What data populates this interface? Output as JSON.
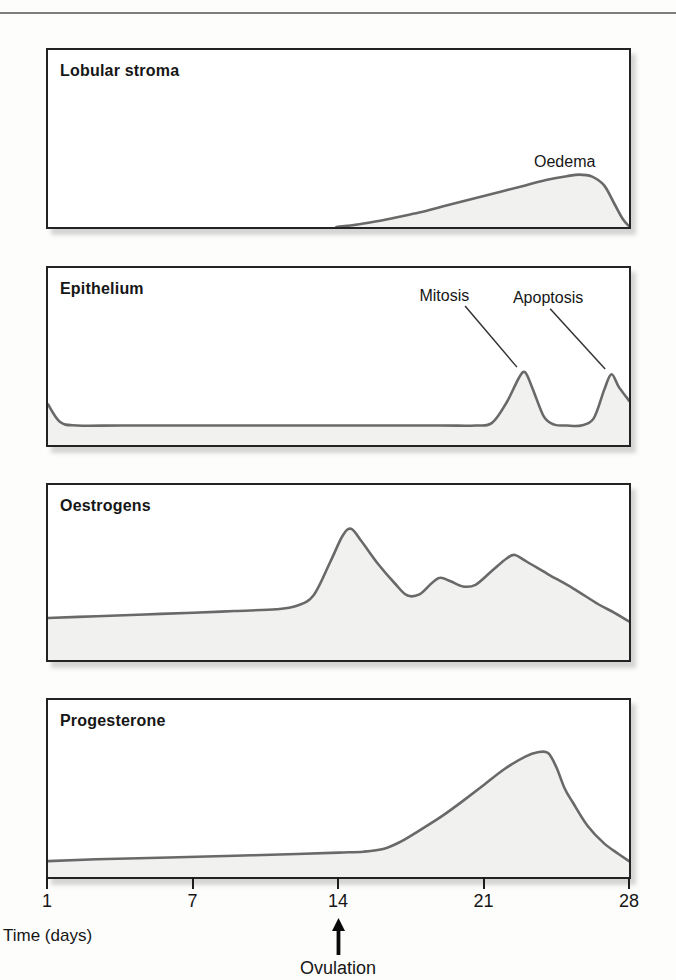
{
  "axis": {
    "axis_label": "Time (days)",
    "ticks": [
      {
        "label": "1",
        "day": 1
      },
      {
        "label": "7",
        "day": 7
      },
      {
        "label": "14",
        "day": 14
      },
      {
        "label": "21",
        "day": 21
      },
      {
        "label": "28",
        "day": 28
      }
    ],
    "ovulation": {
      "label": "Ovulation",
      "day": 14
    }
  },
  "chart_data": [
    {
      "type": "area",
      "title": "Lobular stroma",
      "xlabel": "Time (days)",
      "x_range": [
        1,
        28
      ],
      "x_ticks": [
        1,
        7,
        14,
        21,
        28
      ],
      "value_unit": "relative level (% of panel height)",
      "points": [
        [
          13.9,
          0
        ],
        [
          15,
          1.5
        ],
        [
          16,
          3.5
        ],
        [
          17,
          6
        ],
        [
          18,
          8.5
        ],
        [
          19,
          11.5
        ],
        [
          20,
          14.5
        ],
        [
          21,
          17.5
        ],
        [
          22,
          20.5
        ],
        [
          23,
          23.5
        ],
        [
          24,
          26.5
        ],
        [
          25,
          28.7
        ],
        [
          25.6,
          29.6
        ],
        [
          26.2,
          28.6
        ],
        [
          26.8,
          23.5
        ],
        [
          27.3,
          13
        ],
        [
          27.7,
          4.5
        ],
        [
          28,
          0.5
        ]
      ],
      "annotations": [
        {
          "text": "Oedema",
          "day": 24.9,
          "level": 37
        }
      ],
      "leaders": []
    },
    {
      "type": "area",
      "title": "Epithelium",
      "xlabel": "Time (days)",
      "x_range": [
        1,
        28
      ],
      "x_ticks": [
        1,
        7,
        14,
        21,
        28
      ],
      "value_unit": "relative level (% of panel height)",
      "points": [
        [
          1,
          23
        ],
        [
          1.5,
          13
        ],
        [
          2.2,
          11
        ],
        [
          4,
          11
        ],
        [
          7,
          11
        ],
        [
          10,
          11
        ],
        [
          13,
          11
        ],
        [
          16,
          11
        ],
        [
          19,
          11
        ],
        [
          20.6,
          11
        ],
        [
          21.4,
          12.5
        ],
        [
          22.1,
          24
        ],
        [
          22.7,
          38
        ],
        [
          23,
          41
        ],
        [
          23.35,
          32
        ],
        [
          23.9,
          16
        ],
        [
          24.4,
          11.5
        ],
        [
          25,
          11
        ],
        [
          25.7,
          11
        ],
        [
          26.3,
          15
        ],
        [
          26.8,
          31
        ],
        [
          27.15,
          40
        ],
        [
          27.5,
          33
        ],
        [
          28,
          25
        ]
      ],
      "annotations": [
        {
          "text": "Mitosis",
          "day": 19.1,
          "level": 84
        },
        {
          "text": "Apoptosis",
          "day": 24.1,
          "level": 83
        }
      ],
      "leaders": [
        {
          "from": [
            20.1,
            78.5
          ],
          "to": [
            22.6,
            44
          ]
        },
        {
          "from": [
            24.2,
            77
          ],
          "to": [
            26.85,
            43
          ]
        }
      ]
    },
    {
      "type": "area",
      "title": "Oestrogens",
      "xlabel": "Time (days)",
      "x_range": [
        1,
        28
      ],
      "x_ticks": [
        1,
        7,
        14,
        21,
        28
      ],
      "value_unit": "relative level (% of panel height)",
      "points": [
        [
          1,
          24
        ],
        [
          3,
          25
        ],
        [
          5,
          26
        ],
        [
          7,
          27
        ],
        [
          9,
          28
        ],
        [
          11,
          29
        ],
        [
          12,
          31
        ],
        [
          12.8,
          37
        ],
        [
          13.6,
          56
        ],
        [
          14.2,
          71
        ],
        [
          14.6,
          75
        ],
        [
          15.1,
          68
        ],
        [
          15.9,
          55
        ],
        [
          16.7,
          44
        ],
        [
          17.3,
          37
        ],
        [
          17.9,
          37.5
        ],
        [
          18.5,
          44
        ],
        [
          18.9,
          47
        ],
        [
          19.4,
          45
        ],
        [
          20,
          42
        ],
        [
          20.6,
          43
        ],
        [
          21.4,
          51
        ],
        [
          22.1,
          58
        ],
        [
          22.5,
          60
        ],
        [
          23.1,
          56
        ],
        [
          24.1,
          49
        ],
        [
          25.3,
          41
        ],
        [
          26.5,
          32
        ],
        [
          27.3,
          27
        ],
        [
          28,
          22
        ]
      ],
      "annotations": [],
      "leaders": []
    },
    {
      "type": "area",
      "title": "Progesterone",
      "xlabel": "Time (days)",
      "x_range": [
        1,
        28
      ],
      "x_ticks": [
        1,
        7,
        14,
        21,
        28
      ],
      "value_unit": "relative level (% of panel height)",
      "points": [
        [
          1,
          9
        ],
        [
          3,
          10
        ],
        [
          6,
          11
        ],
        [
          9,
          12
        ],
        [
          12,
          13
        ],
        [
          14,
          13.8
        ],
        [
          15.2,
          14.3
        ],
        [
          16.2,
          16
        ],
        [
          17,
          20
        ],
        [
          18,
          27
        ],
        [
          19,
          34.5
        ],
        [
          20,
          43
        ],
        [
          21,
          52
        ],
        [
          22,
          61
        ],
        [
          23,
          68
        ],
        [
          23.6,
          70.5
        ],
        [
          24.1,
          70
        ],
        [
          24.5,
          62
        ],
        [
          24.9,
          50
        ],
        [
          25.3,
          42
        ],
        [
          26,
          29
        ],
        [
          26.8,
          19
        ],
        [
          27.5,
          13
        ],
        [
          28,
          9
        ]
      ],
      "annotations": [],
      "leaders": []
    }
  ],
  "style": {
    "curve_color": "#696969",
    "fill_color": "#f1f1f0",
    "border_color": "#232323",
    "leader_color": "#333333",
    "arrow_color": "#0a0a0a",
    "rule_color": "#7d7d7d"
  }
}
